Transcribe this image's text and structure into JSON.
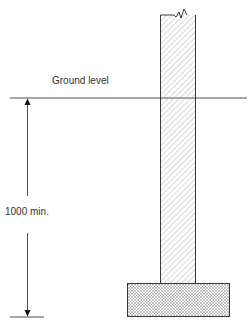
{
  "diagram": {
    "labels": {
      "ground_level": "Ground level",
      "depth": "1000 min."
    },
    "elements": [
      "wall",
      "footing",
      "ground-line",
      "dimension-arrow"
    ],
    "colors": {
      "line": "#222222",
      "hatch": "#888888"
    }
  }
}
